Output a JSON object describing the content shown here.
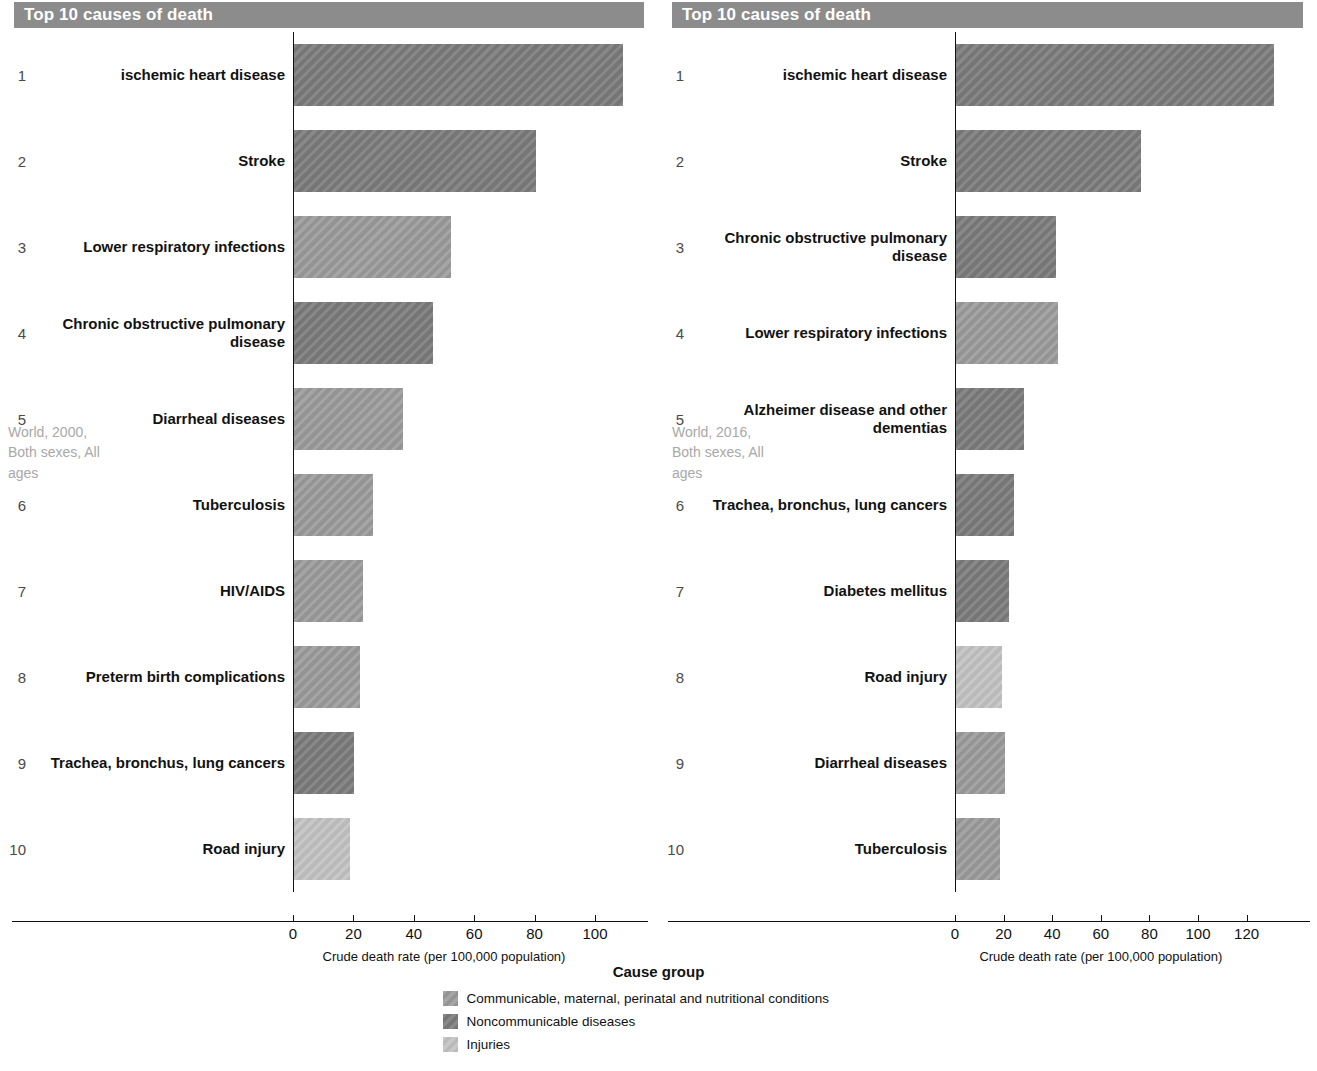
{
  "panels": [
    {
      "header_title": "Top 10 causes of death",
      "facet_label": "World, 2000, Both sexes, All ages",
      "axis_caption": "Crude death rate (per 100,000 population)",
      "ticks": [
        "0",
        "20",
        "40",
        "60",
        "80",
        "100"
      ]
    },
    {
      "header_title": "Top 10 causes of death",
      "facet_label": "World, 2016, Both sexes, All ages",
      "axis_caption": "Crude death rate (per 100,000 population)",
      "ticks": [
        "0",
        "20",
        "40",
        "60",
        "80",
        "100",
        "120"
      ]
    }
  ],
  "legend": {
    "title": "Cause group",
    "items": [
      {
        "label": "Communicable, maternal, perinatal and nutritional conditions",
        "color": "#9b9b9b"
      },
      {
        "label": "Noncommunicable diseases",
        "color": "#7b7b7b"
      },
      {
        "label": "Injuries",
        "color": "#c2c2c2"
      }
    ]
  },
  "colors": {
    "communicable": "#9b9b9b",
    "noncommunicable": "#7b7b7b",
    "injuries": "#c2c2c2",
    "header_bar": "#8c8c8c",
    "facet_text": "#a8a8a8",
    "axis": "#111111"
  },
  "chart_data": [
    {
      "type": "bar",
      "title": "Top 10 causes of death",
      "subtitle": "World, 2000, Both sexes, All ages",
      "orientation": "horizontal",
      "xlabel": "Crude death rate (per 100,000 population)",
      "ylabel": "",
      "xlim": [
        0,
        115
      ],
      "xticks": [
        0,
        20,
        40,
        60,
        80,
        100
      ],
      "grid": false,
      "legend_position": "bottom-center",
      "ranks": [
        1,
        2,
        3,
        4,
        5,
        6,
        7,
        8,
        9,
        10
      ],
      "categories": [
        "ischemic heart disease",
        "Stroke",
        "Lower respiratory infections",
        "Chronic obstructive pulmonary disease",
        "Diarrheal diseases",
        "Tuberculosis",
        "HIV/AIDS",
        "Preterm birth complications",
        "Trachea, bronchus, lung cancers",
        "Road injury"
      ],
      "values": [
        109,
        80,
        52,
        46,
        36,
        26,
        23,
        22,
        20,
        18.5
      ],
      "groups": [
        "noncommunicable",
        "noncommunicable",
        "communicable",
        "noncommunicable",
        "communicable",
        "communicable",
        "communicable",
        "communicable",
        "noncommunicable",
        "injuries"
      ]
    },
    {
      "type": "bar",
      "title": "Top 10 causes of death",
      "subtitle": "World, 2016, Both sexes, All ages",
      "orientation": "horizontal",
      "xlabel": "Crude death rate (per 100,000 population)",
      "ylabel": "",
      "xlim": [
        0,
        135
      ],
      "xticks": [
        0,
        20,
        40,
        60,
        80,
        100,
        120
      ],
      "grid": false,
      "legend_position": "bottom-center",
      "ranks": [
        1,
        2,
        3,
        4,
        5,
        6,
        7,
        8,
        9,
        10
      ],
      "categories": [
        "ischemic heart disease",
        "Stroke",
        "Chronic obstructive pulmonary disease",
        "Lower respiratory infections",
        "Alzheimer disease and other dementias",
        "Trachea, bronchus, lung cancers",
        "Diabetes mellitus",
        "Road injury",
        "Diarrheal diseases",
        "Tuberculosis"
      ],
      "values": [
        131,
        76,
        41,
        42,
        28,
        24,
        22,
        19,
        20,
        18
      ],
      "groups": [
        "noncommunicable",
        "noncommunicable",
        "noncommunicable",
        "communicable",
        "noncommunicable",
        "noncommunicable",
        "noncommunicable",
        "injuries",
        "communicable",
        "communicable"
      ]
    }
  ]
}
